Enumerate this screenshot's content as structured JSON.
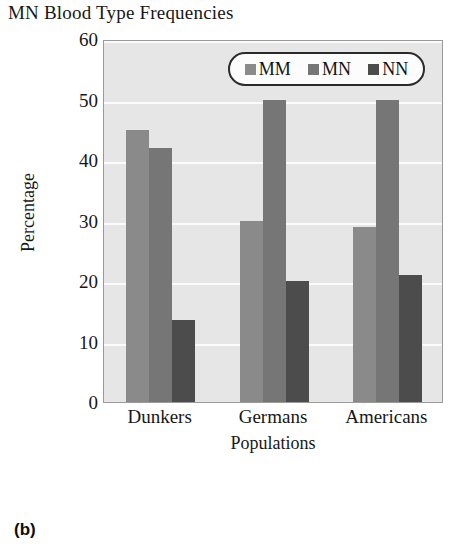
{
  "figure": {
    "panel_caption": "(b)"
  },
  "chart_data": {
    "type": "bar",
    "title": "MN Blood Type Frequencies",
    "xlabel": "Populations",
    "ylabel": "Percentage",
    "categories": [
      "Dunkers",
      "Germans",
      "Americans"
    ],
    "series": [
      {
        "name": "MM",
        "color": "#8a8a8a",
        "values": [
          45,
          30,
          29
        ]
      },
      {
        "name": "MN",
        "color": "#767676",
        "values": [
          42,
          50,
          50
        ]
      },
      {
        "name": "NN",
        "color": "#4c4c4c",
        "values": [
          13.5,
          20,
          21
        ]
      }
    ],
    "ylim": [
      0,
      60
    ],
    "yticks": [
      0,
      10,
      20,
      30,
      40,
      50,
      60
    ],
    "ytick_labels": [
      "0",
      "10",
      "20",
      "30",
      "40",
      "50",
      "60"
    ],
    "grid": true,
    "legend_position": "top-right",
    "plot_background": "#e6e6e6",
    "gridline_color": "#fbfbfb"
  }
}
